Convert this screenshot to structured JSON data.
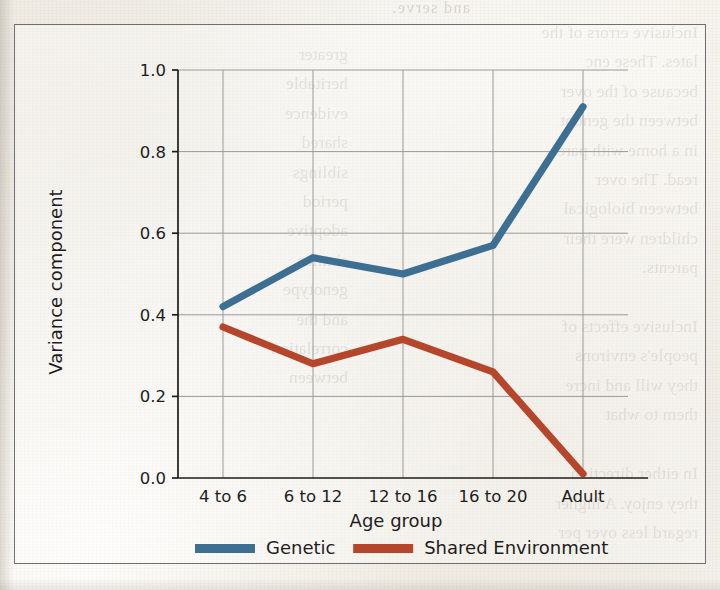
{
  "figure": {
    "plot_background": "#ffffff",
    "frame_color": "#6f6f6f"
  },
  "page_scan": {
    "ghost_heading": "and serve.",
    "ghost_left_column": "Inclusive errors of the\nlates. These enc\nbecause of the over\nbetween the genopt\nin a home with pare\nread. The over\nbetween biological\nchildren were their\nparents.\n\nInclusive effects of\npeople's environs\nthey will and incre\nthem to what\n\nIn either direction\nthey enjoy. A higher\nregard less over per",
    "ghost_right_column": "greater\nheritable\nevidence\nshared\nsiblings\nperiod\nadoptive\nsimilar\ngenotype\nand the\ncorrelation\nbetween"
  },
  "chart_data": {
    "type": "line",
    "title": "",
    "xlabel": "Age group",
    "ylabel": "Variance component",
    "categories": [
      "4 to 6",
      "6 to 12",
      "12 to 16",
      "16 to 20",
      "Adult"
    ],
    "ylim": [
      0.0,
      1.0
    ],
    "yticks": [
      "0.0",
      "0.2",
      "0.4",
      "0.6",
      "0.8",
      "1.0"
    ],
    "ytick_values": [
      0.0,
      0.2,
      0.4,
      0.6,
      0.8,
      1.0
    ],
    "grid": true,
    "legend_position": "bottom-center",
    "series": [
      {
        "name": "Genetic",
        "color": "#3c6f91",
        "values": [
          0.42,
          0.54,
          0.5,
          0.57,
          0.91
        ]
      },
      {
        "name": "Shared Environment",
        "color": "#b5462b",
        "values": [
          0.37,
          0.28,
          0.34,
          0.26,
          0.01
        ]
      }
    ]
  },
  "legend": {
    "items": [
      {
        "label": "Genetic",
        "color": "#3c6f91"
      },
      {
        "label": "Shared Environment",
        "color": "#b5462b"
      }
    ]
  }
}
